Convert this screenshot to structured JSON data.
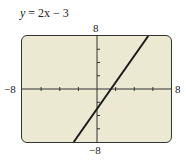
{
  "title": {
    "lhs": "y",
    "rhs": "= 2x − 3"
  },
  "axis_labels": {
    "ymax": "8",
    "ymin": "−8",
    "xmin": "−8",
    "xmax": "8"
  },
  "colors": {
    "background": "#ece9d3",
    "frame": "#333333",
    "line": "#1a1a1a"
  },
  "chart_data": {
    "type": "line",
    "title": "y = 2x − 3",
    "xlabel": "",
    "ylabel": "",
    "xlim": [
      -8,
      8
    ],
    "ylim": [
      -8,
      8
    ],
    "xticks": [
      -8,
      -6,
      -4,
      -2,
      0,
      2,
      4,
      6,
      8
    ],
    "yticks": [
      -8,
      -6,
      -4,
      -2,
      0,
      2,
      4,
      6,
      8
    ],
    "grid": false,
    "series": [
      {
        "name": "y = 2x − 3",
        "x": [
          -2.5,
          5.5
        ],
        "y": [
          -8,
          8
        ]
      }
    ]
  }
}
